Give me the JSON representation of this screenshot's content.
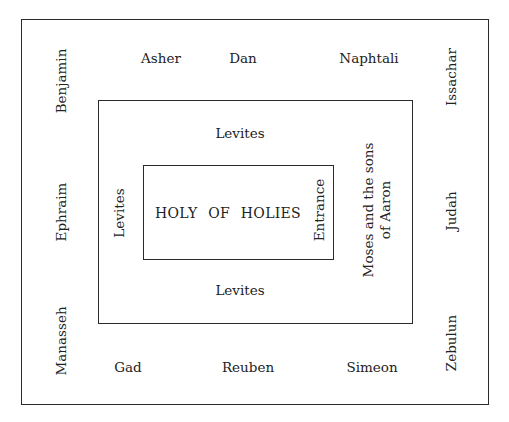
{
  "diagram": {
    "title_cut_off": true,
    "outer_camp": {
      "top": [
        "Asher",
        "Dan",
        "Naphtali"
      ],
      "bottom": [
        "Gad",
        "Reuben",
        "Simeon"
      ],
      "left": [
        "Benjamin",
        "Ephraim",
        "Manasseh"
      ],
      "right": [
        "Issachar",
        "Judah",
        "Zebulun"
      ]
    },
    "levite_ring": {
      "top": "Levites",
      "bottom": "Levites",
      "left": "Levites",
      "right_line1": "Moses and the sons",
      "right_line2": "of Aaron"
    },
    "sanctuary": {
      "label": "HOLY OF HOLIES",
      "entrance": "Entrance"
    },
    "colors": {
      "line": "#2a2a2a",
      "text": "#222222",
      "background": "#ffffff"
    }
  }
}
